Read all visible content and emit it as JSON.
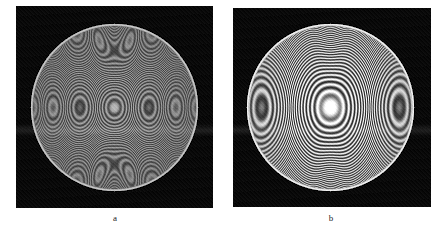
{
  "figure": {
    "background_color": "#ffffff",
    "width": 446,
    "height": 233,
    "kind": "two-panel grayscale interferogram comparison"
  },
  "panels": [
    {
      "id": "a",
      "caption": "a",
      "frame": {
        "x": 16,
        "y": 6,
        "width": 197,
        "height": 202
      },
      "background_color": "#050505",
      "aperture": {
        "shape": "circle",
        "center_x": 114,
        "center_y": 107,
        "radius": 84,
        "edge_color": "#b9b9b9"
      },
      "fringes": {
        "description": "dense fine concentric and lobed interference fringes",
        "ring_period_px": 2.4,
        "ring_count": 34,
        "contrast": "low",
        "core_brightness": "#d8d8d8",
        "lobe_shape": "kidney",
        "vertical_bundle": true
      }
    },
    {
      "id": "b",
      "caption": "b",
      "frame": {
        "x": 233,
        "y": 8,
        "width": 198,
        "height": 199
      },
      "background_color": "#050505",
      "aperture": {
        "shape": "circle",
        "center_x": 330,
        "center_y": 107,
        "radius": 84,
        "edge_color": "#e6e6e6"
      },
      "fringes": {
        "description": "coarse high-contrast concentric and lobed interference fringes",
        "ring_period_px": 5.6,
        "ring_count": 15,
        "contrast": "high",
        "core_brightness": "#ffffff",
        "lobe_shape": "kidney",
        "vertical_bundle": true
      }
    }
  ],
  "captions": {
    "a": "a",
    "b": "b"
  },
  "colors": {
    "page": "#ffffff",
    "panel_background": "#050505",
    "fringe_bright": "#ffffff",
    "fringe_dark": "#000000",
    "caption_text": "#1c1c1c"
  }
}
